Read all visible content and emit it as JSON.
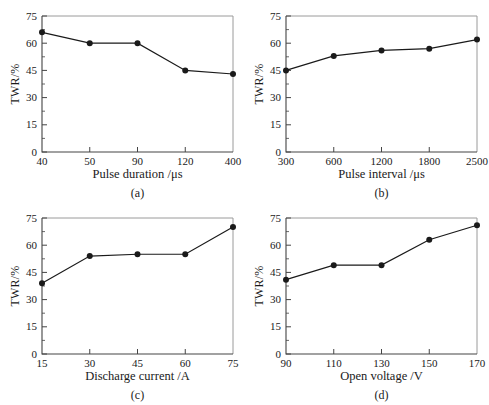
{
  "figure": {
    "panels": [
      "(a)",
      "(b)",
      "(c)",
      "(d)"
    ]
  },
  "colors": {
    "line": "#1a1a1a",
    "marker": "#1a1a1a",
    "axis": "#444444",
    "box": "#9a9a9a",
    "text": "#1a1a1a",
    "background": "#ffffff"
  },
  "chart_data": [
    {
      "type": "line",
      "panel": "(a)",
      "xlabel": "Pulse duration /μs",
      "ylabel": "TWR/%",
      "categories": [
        "40",
        "50",
        "90",
        "120",
        "400"
      ],
      "values": [
        66,
        60,
        60,
        45,
        43
      ],
      "ylim": [
        0,
        75
      ],
      "yticks": [
        0,
        15,
        30,
        45,
        60,
        75
      ],
      "grid": false,
      "legend": "none"
    },
    {
      "type": "line",
      "panel": "(b)",
      "xlabel": "Pulse interval /μs",
      "ylabel": "TWR/%",
      "categories": [
        "300",
        "600",
        "1200",
        "1800",
        "2500"
      ],
      "values": [
        45,
        53,
        56,
        57,
        62
      ],
      "ylim": [
        0,
        75
      ],
      "yticks": [
        0,
        15,
        30,
        45,
        60,
        75
      ],
      "grid": false,
      "legend": "none"
    },
    {
      "type": "line",
      "panel": "(c)",
      "xlabel": "Discharge current /A",
      "ylabel": "TWR/%",
      "categories": [
        "15",
        "30",
        "45",
        "60",
        "75"
      ],
      "values": [
        39,
        54,
        55,
        55,
        70
      ],
      "ylim": [
        0,
        75
      ],
      "yticks": [
        0,
        15,
        30,
        45,
        60,
        75
      ],
      "grid": false,
      "legend": "none"
    },
    {
      "type": "line",
      "panel": "(d)",
      "xlabel": "Open voltage /V",
      "ylabel": "TWR/%",
      "categories": [
        "90",
        "110",
        "130",
        "150",
        "170"
      ],
      "values": [
        41,
        49,
        49,
        63,
        71
      ],
      "ylim": [
        0,
        75
      ],
      "yticks": [
        0,
        15,
        30,
        45,
        60,
        75
      ],
      "grid": false,
      "legend": "none"
    }
  ]
}
